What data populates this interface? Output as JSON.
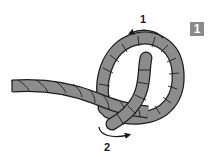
{
  "figure": {
    "type": "knot-tying-step",
    "step_number": "1",
    "arrows": [
      {
        "label": "1",
        "direction": "counter-clockwise over top of loop"
      },
      {
        "label": "2",
        "direction": "clockwise under bottom of loop"
      }
    ]
  },
  "colors": {
    "rope_fill": "#8c8c8c",
    "rope_outline": "#1e1e1e",
    "badge_bg": "#8a8a8a",
    "badge_text": "#ffffff",
    "arrow": "#1a1a1a"
  }
}
